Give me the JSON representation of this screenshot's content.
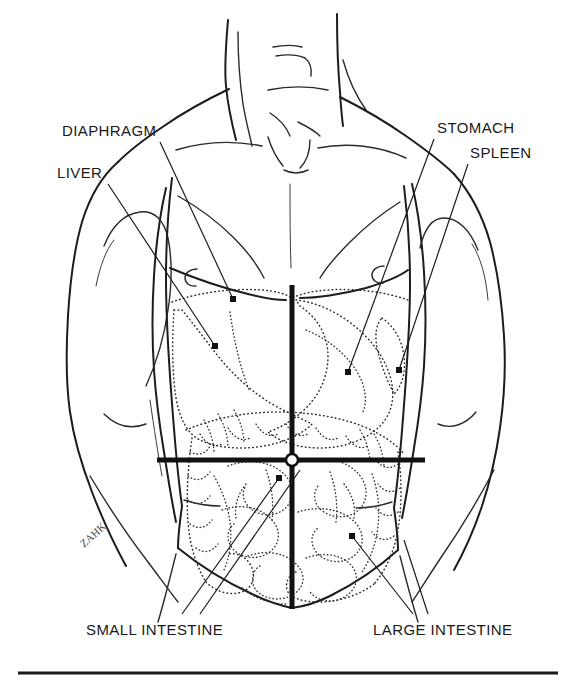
{
  "figure": {
    "signature": "ZAHK",
    "background_color": "#ffffff",
    "line_color": "#1c1c1c",
    "organ_outline_color": "#2e2e2e",
    "quadrant_line_color": "#111111"
  },
  "labels": [
    {
      "id": "diaphragm",
      "text": "DIAPHRAGM",
      "side": "left",
      "text_x": 62,
      "text_y": 136,
      "leader_from_x": 160,
      "leader_from_y": 142,
      "leader_to_x": 233,
      "leader_to_y": 299
    },
    {
      "id": "liver",
      "text": "LIVER",
      "side": "left",
      "text_x": 57,
      "text_y": 178,
      "leader_from_x": 108,
      "leader_from_y": 184,
      "leader_to_x": 215,
      "leader_to_y": 346
    },
    {
      "id": "stomach",
      "text": "STOMACH",
      "side": "right",
      "text_x": 437,
      "text_y": 133,
      "leader_from_x": 434,
      "leader_from_y": 139,
      "leader_to_x": 348,
      "leader_to_y": 372
    },
    {
      "id": "spleen",
      "text": "SPLEEN",
      "side": "right",
      "text_x": 470,
      "text_y": 158,
      "leader_from_x": 468,
      "leader_from_y": 164,
      "leader_to_x": 399,
      "leader_to_y": 370
    },
    {
      "id": "small-intestine",
      "text": "SMALL INTESTINE",
      "side": "bottom-left",
      "text_x": 86,
      "text_y": 635,
      "leader_from_x": 182,
      "leader_from_y": 614,
      "leader_to_x": 279,
      "leader_to_y": 478
    },
    {
      "id": "large-intestine",
      "text": "LARGE INTESTINE",
      "side": "bottom-right",
      "text_x": 373,
      "text_y": 635,
      "leader_from_x": 413,
      "leader_from_y": 614,
      "leader_to_x": 352,
      "leader_to_y": 536
    }
  ],
  "quadrant_lines": {
    "vertical": {
      "x": 292,
      "y1": 285,
      "y2": 609
    },
    "horizontal": {
      "y": 460,
      "x1": 157,
      "x2": 425
    },
    "description": "umbilicus-centered four-quadrant reference cross"
  },
  "baseline_rule": {
    "x1": 18,
    "x2": 558,
    "y": 673
  },
  "nipples": [
    {
      "cx": 192,
      "cy": 277
    },
    {
      "cx": 379,
      "cy": 274
    }
  ],
  "organs": [
    {
      "id": "liver-outline",
      "name": "liver",
      "style": "dotted"
    },
    {
      "id": "stomach-outline",
      "name": "stomach",
      "style": "dotted"
    },
    {
      "id": "spleen-outline",
      "name": "spleen",
      "style": "dotted"
    },
    {
      "id": "small-intestine-coils",
      "name": "small intestine",
      "style": "dotted"
    },
    {
      "id": "large-intestine-outline",
      "name": "large intestine",
      "style": "dotted"
    },
    {
      "id": "diaphragm-dome",
      "name": "diaphragm",
      "style": "dotted"
    }
  ]
}
